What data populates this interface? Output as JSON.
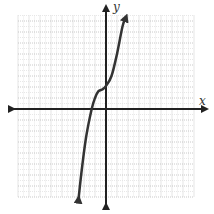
{
  "chart_data": {
    "type": "line",
    "title": "",
    "xlabel": "x",
    "ylabel": "y",
    "xlim": [
      -8,
      8
    ],
    "ylim": [
      -8,
      8.5
    ],
    "grid": true,
    "legend": null,
    "tick_labels": false,
    "series": [
      {
        "name": "curve",
        "description": "cubic-like increasing curve with inflection near (-0.7, 1.7), y-intercept about 2, x-intercept about -1.3, arrows at both ends",
        "x": [
          -2.5,
          -2.2,
          -1.8,
          -1.3,
          -1.0,
          -0.7,
          -0.3,
          0,
          0.5,
          1.0,
          1.5,
          1.8
        ],
        "y": [
          -8.2,
          -5.5,
          -2.5,
          0,
          1.0,
          1.6,
          1.8,
          2.1,
          3.0,
          5.0,
          7.5,
          8.3
        ]
      }
    ]
  },
  "labels": {
    "x": "x",
    "y": "y"
  },
  "colors": {
    "grid": "#c8c8c8",
    "axis": "#222222",
    "curve": "#333333"
  }
}
